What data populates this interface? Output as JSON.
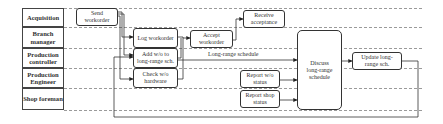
{
  "diagram": {
    "type": "swimlane-process-flow",
    "lanes": [
      {
        "id": "acquisition",
        "label": "Acquisition"
      },
      {
        "id": "branch-manager",
        "label": "Branch manager"
      },
      {
        "id": "production-controller",
        "label": "Production controller"
      },
      {
        "id": "production-engineer",
        "label": "Production Engineer"
      },
      {
        "id": "shop-foreman",
        "label": "Shop foreman"
      }
    ],
    "nodes": {
      "send_workorder": {
        "label": "Send workorder",
        "lane": "acquisition"
      },
      "log_workorder": {
        "label": "Log workorder",
        "lane": "branch-manager"
      },
      "add_wo": {
        "label": "Add w/o to long-range sch.",
        "lane": "production-controller"
      },
      "check_wo": {
        "label": "Check w/o hardware",
        "lane": "production-engineer"
      },
      "accept_workorder": {
        "label": "Accept workorder",
        "lane": "branch-manager"
      },
      "receive_acceptance": {
        "label": "Receive acceptance",
        "lane": "acquisition"
      },
      "report_wo_status": {
        "label": "Report w/o status",
        "lane": "production-engineer"
      },
      "report_shop_status": {
        "label": "Report shop status",
        "lane": "shop-foreman"
      },
      "discuss_schedule": {
        "label": "Discuss long-range schedule",
        "lane": "branch-manager"
      },
      "update_schedule": {
        "label": "Update long-range sch.",
        "lane": "production-controller"
      }
    },
    "edge_labels": {
      "long_range_schedule": "Long-range schedule"
    },
    "edges": [
      {
        "from": "send_workorder",
        "to": "log_workorder"
      },
      {
        "from": "send_workorder",
        "to": "add_wo"
      },
      {
        "from": "send_workorder",
        "to": "check_wo"
      },
      {
        "from": "log_workorder",
        "to": "accept_workorder"
      },
      {
        "from": "add_wo",
        "to": "accept_workorder"
      },
      {
        "from": "check_wo",
        "to": "accept_workorder"
      },
      {
        "from": "accept_workorder",
        "to": "receive_acceptance"
      },
      {
        "from": "add_wo",
        "to": "discuss_schedule",
        "label": "Long-range schedule"
      },
      {
        "from": "report_wo_status",
        "to": "discuss_schedule"
      },
      {
        "from": "report_shop_status",
        "to": "discuss_schedule"
      },
      {
        "from": "discuss_schedule",
        "to": "update_schedule"
      },
      {
        "from": "update_schedule",
        "to": "add_wo"
      }
    ]
  }
}
